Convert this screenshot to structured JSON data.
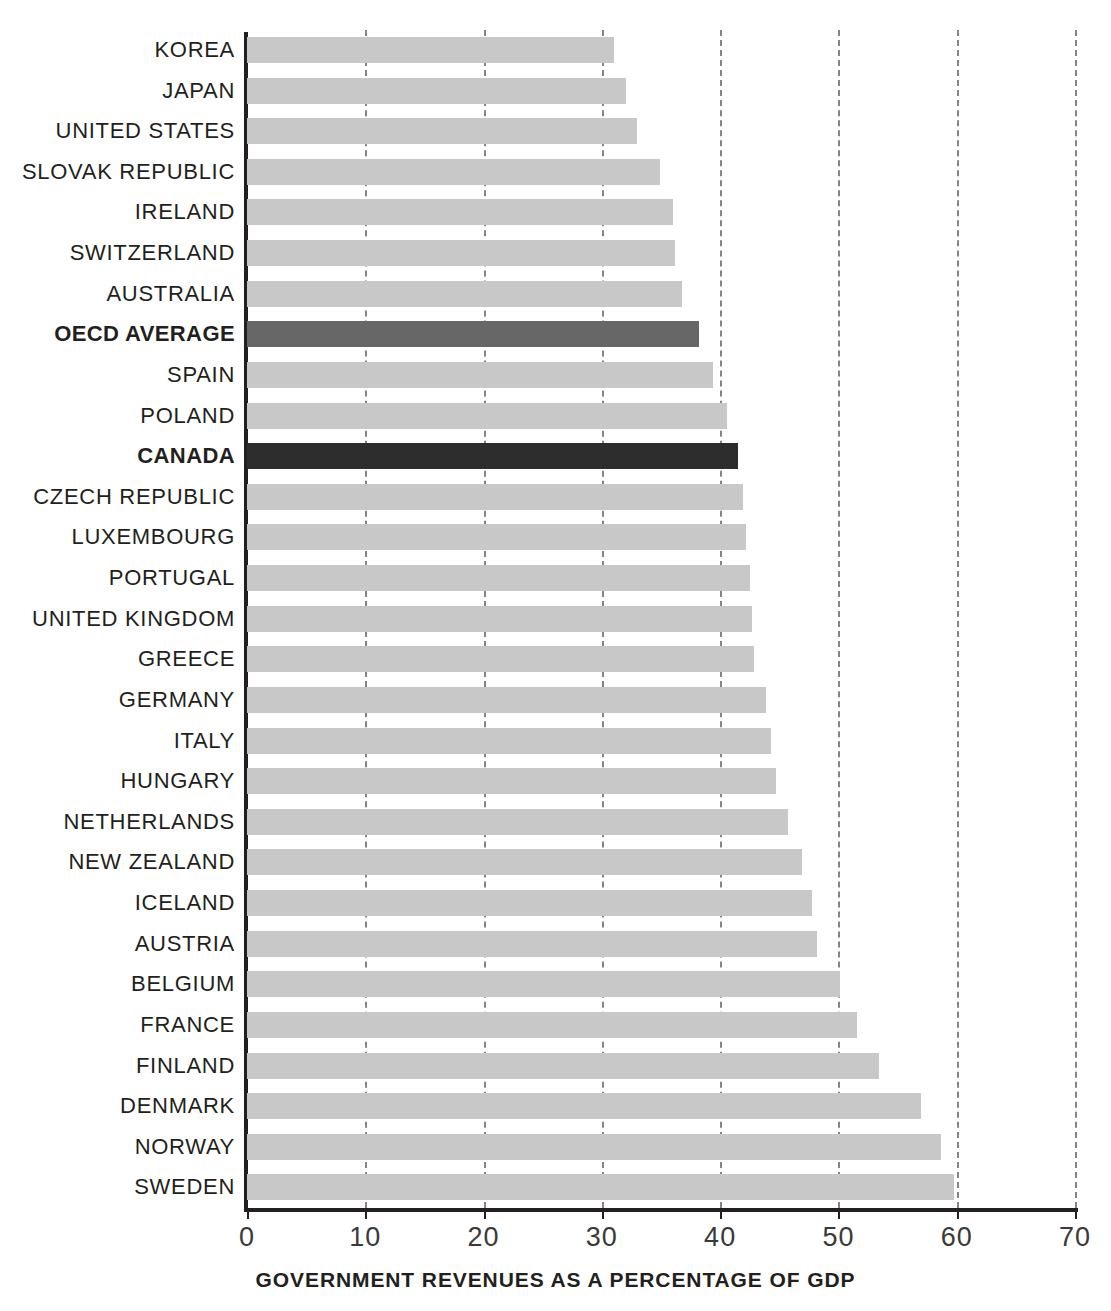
{
  "chart_data": {
    "type": "bar",
    "orientation": "horizontal",
    "title": "",
    "xlabel": "GOVERNMENT REVENUES AS A PERCENTAGE OF GDP",
    "ylabel": "",
    "xlim": [
      0,
      70
    ],
    "xticks": [
      0,
      10,
      20,
      30,
      40,
      50,
      60,
      70
    ],
    "xtick_labels": [
      "0",
      "10",
      "20",
      "30",
      "40",
      "50",
      "60",
      "70"
    ],
    "grid": true,
    "grid_axis": "x",
    "grid_style": "dashed",
    "legend": false,
    "colors": {
      "bar_default": "#c8c8c8",
      "bar_average": "#676767",
      "bar_highlight": "#2d2d2d",
      "axis": "#231f20",
      "grid": "#6f6f6f",
      "text": "#231f20"
    },
    "categories": [
      "KOREA",
      "JAPAN",
      "UNITED STATES",
      "SLOVAK REPUBLIC",
      "IRELAND",
      "SWITZERLAND",
      "AUSTRALIA",
      "OECD AVERAGE",
      "SPAIN",
      "POLAND",
      "CANADA",
      "CZECH REPUBLIC",
      "LUXEMBOURG",
      "PORTUGAL",
      "UNITED KINGDOM",
      "GREECE",
      "GERMANY",
      "ITALY",
      "HUNGARY",
      "NETHERLANDS",
      "NEW ZEALAND",
      "ICELAND",
      "AUSTRIA",
      "BELGIUM",
      "FRANCE",
      "FINLAND",
      "DENMARK",
      "NORWAY",
      "SWEDEN"
    ],
    "values": [
      31.0,
      32.0,
      33.0,
      34.9,
      36.0,
      36.2,
      36.8,
      38.2,
      39.4,
      40.6,
      41.5,
      41.9,
      42.2,
      42.5,
      42.7,
      42.9,
      43.9,
      44.3,
      44.7,
      45.7,
      46.9,
      47.8,
      48.2,
      50.1,
      51.6,
      53.4,
      57.0,
      58.7,
      59.8
    ],
    "emphasis": [
      "none",
      "none",
      "none",
      "none",
      "none",
      "none",
      "none",
      "average",
      "none",
      "none",
      "highlight",
      "none",
      "none",
      "none",
      "none",
      "none",
      "none",
      "none",
      "none",
      "none",
      "none",
      "none",
      "none",
      "none",
      "none",
      "none",
      "none",
      "none",
      "none"
    ]
  },
  "top_strip": {
    "clipped_text": ""
  }
}
